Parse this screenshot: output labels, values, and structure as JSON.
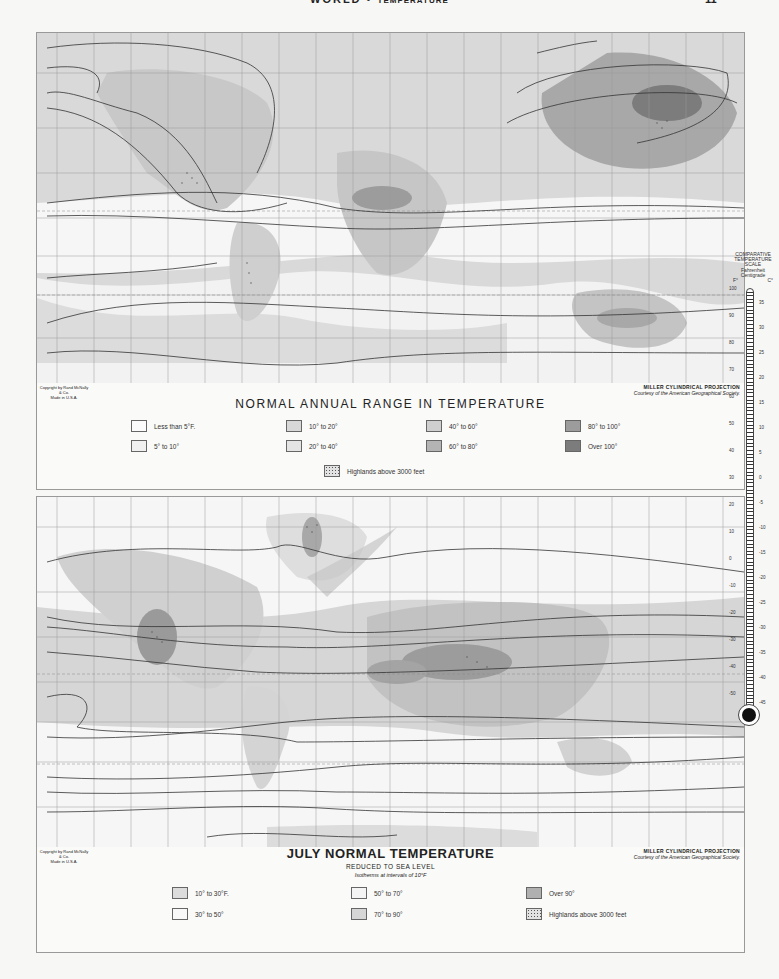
{
  "header": {
    "section": "WORLD",
    "separator": "•",
    "topic": "TEMPERATURE",
    "page_number": "11"
  },
  "top_map": {
    "title": "NORMAL ANNUAL RANGE IN TEMPERATURE",
    "copyright": [
      "Copyright by Rand McNally & Co.",
      "Made in U.S.A."
    ],
    "projection": "MILLER CYLINDRICAL PROJECTION",
    "courtesy": "Courtesy of the American Geographical Society.",
    "map_labels": [
      "Arctic Circle",
      "Tropic of Cancer",
      "Equator",
      "Tropic of Capricorn"
    ],
    "isotherm_labels_left": [
      "70°",
      "50°",
      "50°",
      "40°",
      "30°",
      "20°",
      "10°",
      "5°",
      "5°",
      "10°",
      "10°"
    ],
    "isotherm_labels_right": [
      "70°",
      "60°",
      "50°",
      "40°",
      "30°",
      "20°",
      "10°",
      "5°",
      "5°",
      "10°",
      "10°"
    ],
    "legend": [
      {
        "label": "Less than 5°F.",
        "color": "#fbfbfb"
      },
      {
        "label": "5° to 10°",
        "color": "#f0f0f0"
      },
      {
        "label": "10° to 20°",
        "color": "#d8d8d8"
      },
      {
        "label": "20° to 40°",
        "color": "#e4e4e4"
      },
      {
        "label": "40° to 60°",
        "color": "#cfcfcf"
      },
      {
        "label": "60° to 80°",
        "color": "#b4b4b4"
      },
      {
        "label": "80° to 100°",
        "color": "#9c9c9c"
      },
      {
        "label": "Over 100°",
        "color": "#7c7c7c"
      },
      {
        "label": "Highlands above 3000 feet",
        "pattern": "dots"
      }
    ]
  },
  "bottom_map": {
    "title": "JULY NORMAL TEMPERATURE",
    "subtitle": "REDUCED TO SEA LEVEL",
    "note": "Isotherms at intervals of 10°F",
    "copyright": [
      "Copyright by Rand McNally & Co.",
      "Made in U.S.A."
    ],
    "projection": "MILLER CYLINDRICAL PROJECTION",
    "courtesy": "Courtesy of the American Geographical Society.",
    "map_labels": [
      "Arctic Circle",
      "Tropic of Cancer",
      "Equator",
      "Tropic of Capricorn"
    ],
    "isotherm_labels_left": [
      "40°",
      "50°",
      "60°",
      "70°",
      "80°",
      "80°",
      "70°",
      "60°",
      "50°",
      "40°"
    ],
    "isotherm_labels_right": [
      "50°",
      "60°",
      "70°",
      "80°",
      "80°",
      "70°",
      "60°",
      "50°",
      "40°"
    ],
    "bottom_isotherm": "30°",
    "legend": [
      {
        "label": "10° to 30°F.",
        "color": "#dcdcdc"
      },
      {
        "label": "30° to 50°",
        "color": "#f8f8f8"
      },
      {
        "label": "50° to 70°",
        "color": "#f4f4f4"
      },
      {
        "label": "70° to 90°",
        "color": "#d6d6d6"
      },
      {
        "label": "Over 90°",
        "color": "#b0b0b0"
      },
      {
        "label": "Highlands above 3000 feet",
        "pattern": "dots"
      }
    ]
  },
  "thermometer": {
    "title": [
      "COMPARATIVE",
      "TEMPERATURE",
      "SCALE"
    ],
    "scales": [
      "Fahrenheit",
      "Centigrade"
    ],
    "units": [
      "F°",
      "C°"
    ],
    "fahrenheit_ticks": [
      "100",
      "90",
      "80",
      "70",
      "60",
      "50",
      "40",
      "30",
      "20",
      "10",
      "0",
      "-10",
      "-20",
      "-30",
      "-40",
      "-50"
    ],
    "celsius_ticks": [
      "35",
      "30",
      "25",
      "20",
      "15",
      "10",
      "5",
      "0",
      "-5",
      "-10",
      "-15",
      "-20",
      "-25",
      "-30",
      "-35",
      "-40",
      "-45"
    ]
  }
}
